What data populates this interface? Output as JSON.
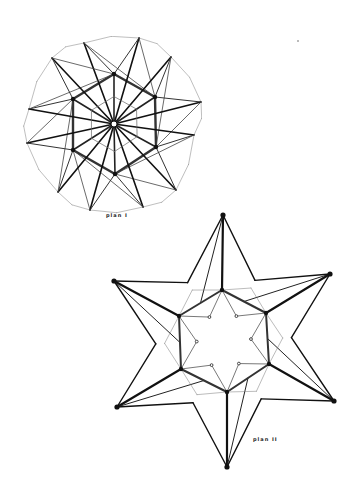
{
  "page": {
    "background": "#ffffff",
    "ink": "#111111"
  },
  "plan1": {
    "caption": "plan I",
    "center": [
      114,
      124
    ],
    "hexagon": [
      [
        114,
        74
      ],
      [
        155,
        97
      ],
      [
        156,
        147
      ],
      [
        115,
        174
      ],
      [
        73,
        150
      ],
      [
        73,
        99
      ]
    ],
    "tips": [
      [
        84,
        43
      ],
      [
        139,
        38
      ],
      [
        171,
        57
      ],
      [
        201,
        102
      ],
      [
        194,
        135
      ],
      [
        176,
        190
      ],
      [
        143,
        207
      ],
      [
        90,
        210
      ],
      [
        58,
        192
      ],
      [
        27,
        143
      ],
      [
        29,
        109
      ],
      [
        52,
        58
      ]
    ]
  },
  "plan2": {
    "caption": "plan II",
    "center": [
      224,
      340
    ],
    "hexagon": [
      [
        222,
        290
      ],
      [
        266,
        313
      ],
      [
        269,
        364
      ],
      [
        227,
        392
      ],
      [
        181,
        369
      ],
      [
        179,
        316
      ]
    ],
    "tips": [
      [
        223,
        215
      ],
      [
        330,
        274
      ],
      [
        334,
        401
      ],
      [
        227,
        467
      ],
      [
        117,
        407
      ],
      [
        114,
        281
      ]
    ]
  }
}
